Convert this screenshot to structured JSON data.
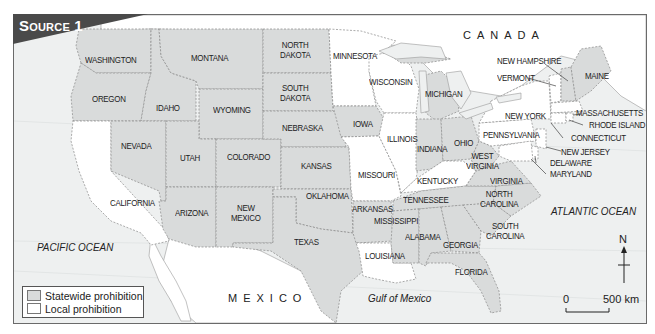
{
  "title": "Source 1",
  "colors": {
    "statewide": "#d9dbdb",
    "local": "#ffffff",
    "water": "#eef0f0",
    "banner": "#4a4a4a",
    "border": "#777777"
  },
  "countries": {
    "canada": "CANADA",
    "mexico": "MEXICO"
  },
  "water_bodies": {
    "pacific": "PACIFIC OCEAN",
    "atlantic": "ATLANTIC OCEAN",
    "gulf": "Gulf of Mexico"
  },
  "states": {
    "washington": {
      "label": "WASHINGTON",
      "status": "statewide"
    },
    "oregon": {
      "label": "OREGON",
      "status": "statewide"
    },
    "california": {
      "label": "CALIFORNIA",
      "status": "local"
    },
    "idaho": {
      "label": "IDAHO",
      "status": "statewide"
    },
    "nevada": {
      "label": "NEVADA",
      "status": "statewide"
    },
    "montana": {
      "label": "MONTANA",
      "status": "statewide"
    },
    "wyoming": {
      "label": "WYOMING",
      "status": "statewide"
    },
    "utah": {
      "label": "UTAH",
      "status": "statewide"
    },
    "arizona": {
      "label": "ARIZONA",
      "status": "statewide"
    },
    "colorado": {
      "label": "COLORADO",
      "status": "statewide"
    },
    "new_mexico": {
      "label_1": "NEW",
      "label_2": "MEXICO",
      "status": "statewide"
    },
    "north_dakota": {
      "label_1": "NORTH",
      "label_2": "DAKOTA",
      "status": "statewide"
    },
    "south_dakota": {
      "label_1": "SOUTH",
      "label_2": "DAKOTA",
      "status": "statewide"
    },
    "nebraska": {
      "label": "NEBRASKA",
      "status": "statewide"
    },
    "kansas": {
      "label": "KANSAS",
      "status": "statewide"
    },
    "oklahoma": {
      "label": "OKLAHOMA",
      "status": "statewide"
    },
    "texas": {
      "label": "TEXAS",
      "status": "statewide"
    },
    "minnesota": {
      "label": "MINNESOTA",
      "status": "local"
    },
    "iowa": {
      "label": "IOWA",
      "status": "statewide"
    },
    "missouri": {
      "label": "MISSOURI",
      "status": "local"
    },
    "arkansas": {
      "label": "ARKANSAS",
      "status": "statewide"
    },
    "louisiana": {
      "label": "LOUISIANA",
      "status": "local"
    },
    "wisconsin": {
      "label": "WISCONSIN",
      "status": "local"
    },
    "illinois": {
      "label": "ILLINOIS",
      "status": "local"
    },
    "michigan": {
      "label": "MICHIGAN",
      "status": "statewide"
    },
    "indiana": {
      "label": "INDIANA",
      "status": "statewide"
    },
    "ohio": {
      "label": "OHIO",
      "status": "statewide"
    },
    "kentucky": {
      "label": "KENTUCKY",
      "status": "local"
    },
    "tennessee": {
      "label": "TENNESSEE",
      "status": "statewide"
    },
    "mississippi": {
      "label": "MISSISSIPPI",
      "status": "statewide"
    },
    "alabama": {
      "label": "ALABAMA",
      "status": "statewide"
    },
    "georgia": {
      "label": "GEORGIA",
      "status": "statewide"
    },
    "florida": {
      "label": "FLORIDA",
      "status": "statewide"
    },
    "south_carolina": {
      "label_1": "SOUTH",
      "label_2": "CAROLINA",
      "status": "statewide"
    },
    "north_carolina": {
      "label_1": "NORTH",
      "label_2": "CAROLINA",
      "status": "statewide"
    },
    "virginia": {
      "label": "VIRGINIA",
      "status": "statewide"
    },
    "west_virginia": {
      "label_1": "WEST",
      "label_2": "VIRGINIA",
      "status": "statewide"
    },
    "pennsylvania": {
      "label": "PENNSYLVANIA",
      "status": "local"
    },
    "new_york": {
      "label": "NEW YORK",
      "status": "local"
    },
    "vermont": {
      "label": "VERMONT",
      "status": "local"
    },
    "new_hampshire": {
      "label": "NEW HAMPSHIRE",
      "status": "statewide"
    },
    "maine": {
      "label": "MAINE",
      "status": "statewide"
    },
    "massachusetts": {
      "label": "MASSACHUSETTS",
      "status": "local"
    },
    "rhode_island": {
      "label": "RHODE ISLAND",
      "status": "local"
    },
    "connecticut": {
      "label": "CONNECTICUT",
      "status": "local"
    },
    "new_jersey": {
      "label": "NEW JERSEY",
      "status": "local"
    },
    "delaware": {
      "label": "DELAWARE",
      "status": "local"
    },
    "maryland": {
      "label": "MARYLAND",
      "status": "local"
    }
  },
  "legend": {
    "items": [
      {
        "label": "Statewide prohibition",
        "color": "#d9dbdb"
      },
      {
        "label": "Local prohibition",
        "color": "#ffffff"
      }
    ]
  },
  "compass": {
    "label": "N"
  },
  "scale": {
    "start": "0",
    "end": "500 km"
  }
}
